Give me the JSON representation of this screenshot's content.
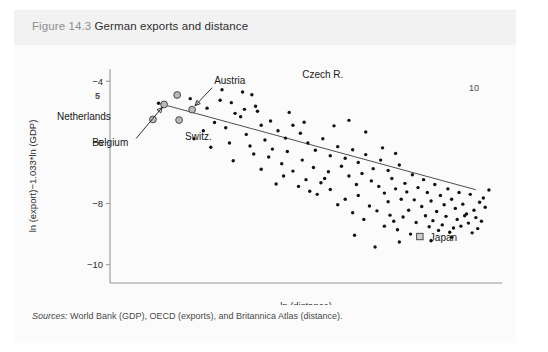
{
  "figure": {
    "number": "Figure 14.3",
    "title": "German exports and distance",
    "source_label": "Sources:",
    "source_text": "World Bank (GDP), OECD (exports), and Britannica Atlas (distance)."
  },
  "marks": {
    "top_right_page_number": "10",
    "axis_side_mark": "5"
  },
  "chart_data": {
    "type": "scatter",
    "title": "German exports and distance",
    "xlabel": "ln (distance)",
    "ylabel": "ln (export)−1.033*ln (GDP)",
    "xlim": [
      6.0,
      10.2
    ],
    "ylim": [
      -10.6,
      -3.6
    ],
    "yticks": [
      -4,
      -6,
      -8,
      -10
    ],
    "ytick_labels": [
      "−4",
      "−6",
      "−8",
      "−10"
    ],
    "xticks": [],
    "xtick_labels": [],
    "grid": false,
    "legend": false,
    "trendline": {
      "label": "fitted regression line",
      "x_start": 6.52,
      "y_start": -4.72,
      "x_end": 9.92,
      "y_end": -7.55
    },
    "annotations": [
      {
        "label": "Czech R.",
        "x": 6.72,
        "y": -4.45,
        "marker": "highlight",
        "leader": false
      },
      {
        "label": "Austria",
        "x": 6.88,
        "y": -4.93,
        "marker": "highlight",
        "leader": true
      },
      {
        "label": "Netherlands",
        "x": 6.46,
        "y": -5.25,
        "marker": "highlight",
        "leader": false
      },
      {
        "label": "Switz.",
        "x": 6.74,
        "y": -5.27,
        "marker": "highlight",
        "leader": false
      },
      {
        "label": "Belgium",
        "x": 6.58,
        "y": -4.76,
        "marker": "highlight",
        "leader": true
      },
      {
        "label": "Japan",
        "x": 9.32,
        "y": -9.08,
        "marker": "square",
        "leader": false
      }
    ],
    "points": [
      [
        6.52,
        -4.72
      ],
      [
        6.86,
        -4.57
      ],
      [
        6.74,
        -5.27
      ],
      [
        6.46,
        -5.25
      ],
      [
        6.72,
        -4.45
      ],
      [
        6.88,
        -4.93
      ],
      [
        7.04,
        -4.88
      ],
      [
        7.18,
        -4.62
      ],
      [
        7.3,
        -4.7
      ],
      [
        7.42,
        -4.35
      ],
      [
        7.52,
        -4.44
      ],
      [
        7.34,
        -5.05
      ],
      [
        7.12,
        -5.35
      ],
      [
        7.24,
        -5.52
      ],
      [
        7.0,
        -5.62
      ],
      [
        6.9,
        -5.88
      ],
      [
        7.4,
        -5.16
      ],
      [
        7.58,
        -4.98
      ],
      [
        7.62,
        -5.44
      ],
      [
        7.72,
        -5.3
      ],
      [
        7.46,
        -5.74
      ],
      [
        7.28,
        -6.02
      ],
      [
        7.08,
        -6.16
      ],
      [
        7.66,
        -5.92
      ],
      [
        7.8,
        -5.62
      ],
      [
        7.88,
        -5.86
      ],
      [
        7.96,
        -5.44
      ],
      [
        8.04,
        -5.7
      ],
      [
        7.74,
        -6.22
      ],
      [
        7.54,
        -6.38
      ],
      [
        7.9,
        -6.3
      ],
      [
        8.12,
        -6.02
      ],
      [
        8.2,
        -6.26
      ],
      [
        8.28,
        -5.88
      ],
      [
        8.36,
        -6.44
      ],
      [
        8.06,
        -6.58
      ],
      [
        7.84,
        -6.7
      ],
      [
        8.44,
        -6.14
      ],
      [
        8.52,
        -6.52
      ],
      [
        8.6,
        -6.24
      ],
      [
        8.18,
        -6.82
      ],
      [
        8.34,
        -6.96
      ],
      [
        8.48,
        -6.78
      ],
      [
        8.66,
        -6.66
      ],
      [
        8.74,
        -6.4
      ],
      [
        8.56,
        -7.1
      ],
      [
        8.7,
        -7.02
      ],
      [
        8.82,
        -6.86
      ],
      [
        8.9,
        -6.58
      ],
      [
        8.98,
        -6.92
      ],
      [
        8.8,
        -7.26
      ],
      [
        8.64,
        -7.38
      ],
      [
        8.88,
        -7.44
      ],
      [
        9.02,
        -7.18
      ],
      [
        9.1,
        -6.74
      ],
      [
        9.06,
        -7.52
      ],
      [
        8.94,
        -7.66
      ],
      [
        9.16,
        -7.34
      ],
      [
        9.24,
        -7.06
      ],
      [
        9.18,
        -7.62
      ],
      [
        9.3,
        -7.48
      ],
      [
        9.36,
        -7.22
      ],
      [
        9.12,
        -7.86
      ],
      [
        8.98,
        -7.94
      ],
      [
        9.26,
        -7.88
      ],
      [
        9.4,
        -7.64
      ],
      [
        9.48,
        -7.38
      ],
      [
        9.44,
        -7.92
      ],
      [
        9.34,
        -8.1
      ],
      [
        9.2,
        -8.22
      ],
      [
        9.54,
        -7.74
      ],
      [
        9.62,
        -7.52
      ],
      [
        9.58,
        -8.04
      ],
      [
        9.5,
        -8.26
      ],
      [
        9.38,
        -8.4
      ],
      [
        9.66,
        -7.86
      ],
      [
        9.74,
        -7.64
      ],
      [
        9.7,
        -8.16
      ],
      [
        9.6,
        -8.42
      ],
      [
        9.46,
        -8.56
      ],
      [
        9.78,
        -8.02
      ],
      [
        9.86,
        -7.7
      ],
      [
        9.82,
        -8.34
      ],
      [
        9.72,
        -8.52
      ],
      [
        9.56,
        -8.7
      ],
      [
        9.9,
        -8.22
      ],
      [
        9.96,
        -7.96
      ],
      [
        9.92,
        -8.46
      ],
      [
        9.84,
        -8.64
      ],
      [
        9.68,
        -8.8
      ],
      [
        8.36,
        -7.54
      ],
      [
        8.22,
        -7.7
      ],
      [
        8.52,
        -7.86
      ],
      [
        8.44,
        -8.04
      ],
      [
        8.66,
        -7.74
      ],
      [
        8.78,
        -8.08
      ],
      [
        8.6,
        -8.3
      ],
      [
        8.86,
        -8.24
      ],
      [
        9.0,
        -8.38
      ],
      [
        8.72,
        -8.52
      ],
      [
        7.96,
        -6.94
      ],
      [
        8.1,
        -7.22
      ],
      [
        7.7,
        -6.48
      ],
      [
        7.62,
        -6.88
      ],
      [
        8.26,
        -7.32
      ],
      [
        9.04,
        -8.58
      ],
      [
        9.14,
        -8.44
      ],
      [
        9.28,
        -8.62
      ],
      [
        9.42,
        -8.76
      ],
      [
        9.52,
        -8.88
      ],
      [
        8.94,
        -8.74
      ],
      [
        9.08,
        -8.86
      ],
      [
        9.22,
        -9.0
      ],
      [
        9.64,
        -8.94
      ],
      [
        9.76,
        -8.74
      ],
      [
        7.86,
        -7.1
      ],
      [
        8.02,
        -7.44
      ],
      [
        8.14,
        -7.6
      ],
      [
        7.78,
        -7.36
      ],
      [
        8.3,
        -7.18
      ],
      [
        9.94,
        -8.82
      ],
      [
        10.02,
        -8.12
      ],
      [
        10.06,
        -7.56
      ],
      [
        9.98,
        -8.58
      ],
      [
        9.88,
        -8.96
      ],
      [
        8.56,
        -5.28
      ],
      [
        8.74,
        -5.66
      ],
      [
        8.92,
        -6.18
      ],
      [
        8.4,
        -5.46
      ],
      [
        9.06,
        -6.36
      ],
      [
        7.44,
        -4.92
      ],
      [
        7.2,
        -4.28
      ],
      [
        7.56,
        -4.82
      ],
      [
        7.92,
        -5.02
      ],
      [
        8.08,
        -5.34
      ],
      [
        8.84,
        -9.42
      ],
      [
        8.62,
        -9.04
      ],
      [
        9.32,
        -9.08
      ],
      [
        9.44,
        -9.22
      ],
      [
        9.1,
        -9.26
      ],
      [
        9.66,
        -9.1
      ],
      [
        9.8,
        -8.4
      ],
      [
        10.0,
        -7.82
      ],
      [
        7.32,
        -6.6
      ],
      [
        7.5,
        -6.12
      ]
    ]
  }
}
